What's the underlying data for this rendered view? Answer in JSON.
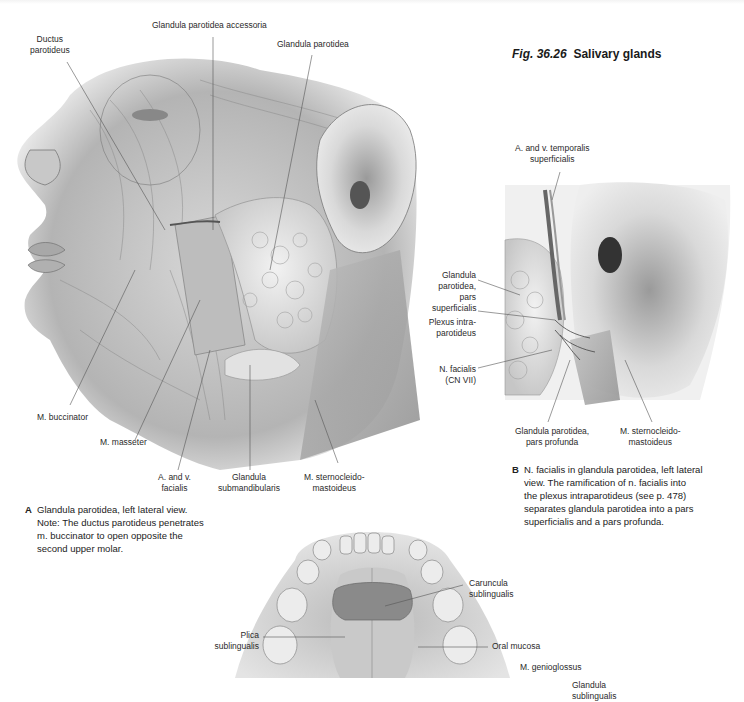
{
  "figure": {
    "number": "Fig. 36.26",
    "fig_prefix": "Fig.",
    "fig_num": "36.26",
    "title": "Salivary glands"
  },
  "panel_a": {
    "letter": "A",
    "caption_lines": [
      "Glandula parotidea, left lateral view.",
      "Note: The ductus parotideus penetrates",
      "m. buccinator to open opposite the",
      "second upper molar."
    ],
    "note_word": "Note",
    "labels": {
      "ductus_parotideus": [
        "Ductus",
        "parotideus"
      ],
      "glandula_parotidea_accessoria": "Glandula parotidea accessoria",
      "glandula_parotidea": "Glandula parotidea",
      "m_buccinator": "M. buccinator",
      "m_masseter": "M. masseter",
      "a_v_facialis": [
        "A. and v.",
        "facialis"
      ],
      "glandula_submandibularis": [
        "Glandula",
        "submandibularis"
      ],
      "m_sternocleidomastoideus": [
        "M. sternocleido-",
        "mastoideus"
      ]
    }
  },
  "panel_b": {
    "letter": "B",
    "caption_lines": [
      "N. facialis in glandula parotidea, left lateral",
      "view. The ramification of n. facialis into",
      "the plexus intraparotideus (see p. 478)",
      "separates glandula parotidea into a pars",
      "superficialis and a pars profunda."
    ],
    "labels": {
      "a_v_temporalis": [
        "A. and v. temporalis",
        "superficialis"
      ],
      "glandula_parotidea_pars_superficialis": [
        "Glandula",
        "parotidea,",
        "pars",
        "superficialis"
      ],
      "plexus_intraparotideus": [
        "Plexus intra-",
        "parotideus"
      ],
      "n_facialis": [
        "N. facialis",
        "(CN VII)"
      ],
      "glandula_parotidea_pars_profunda": [
        "Glandula parotidea,",
        "pars profunda"
      ],
      "m_sternocleidomastoideus": [
        "M. sternocleido-",
        "mastoideus"
      ]
    }
  },
  "panel_c": {
    "labels": {
      "caruncula_sublingualis": [
        "Caruncula",
        "sublingualis"
      ],
      "plica_sublingualis": [
        "Plica",
        "sublingualis"
      ],
      "oral_mucosa": "Oral mucosa",
      "m_genioglossus": "M. genioglossus",
      "glandula_sublingualis": [
        "Glandula",
        "sublingualis"
      ]
    }
  }
}
